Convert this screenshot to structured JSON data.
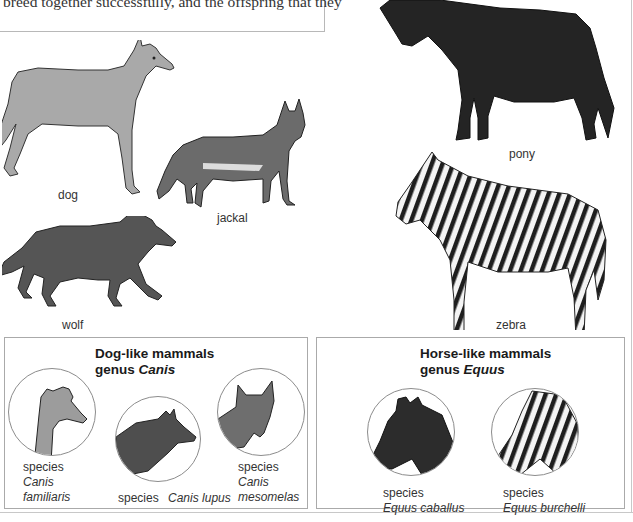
{
  "intro": {
    "text": "breed together successfully, and the offspring that they"
  },
  "illustrations": {
    "dog": {
      "label": "dog"
    },
    "jackal": {
      "label": "jackal"
    },
    "wolf": {
      "label": "wolf"
    },
    "pony": {
      "label": "pony"
    },
    "zebra": {
      "label": "zebra"
    }
  },
  "dog_box": {
    "title_line1": "Dog-like mammals",
    "title_line2_prefix": "genus ",
    "title_line2_genus": "Canis",
    "species": [
      {
        "prefix": "species",
        "name_line1": "Canis",
        "name_line2": "familiaris"
      },
      {
        "prefix": "species",
        "name_line1": "Canis lupus",
        "name_line2": ""
      },
      {
        "prefix": "species",
        "name_line1": "Canis",
        "name_line2": "mesomelas"
      }
    ]
  },
  "horse_box": {
    "title_line1": "Horse-like mammals",
    "title_line2_prefix": "genus ",
    "title_line2_genus": "Equus",
    "species": [
      {
        "prefix": "species",
        "name_line1": "Equus caballus"
      },
      {
        "prefix": "species",
        "name_line1": "Equus burchelli"
      }
    ]
  },
  "colors": {
    "border": "#aaaaaa",
    "text": "#333333",
    "dog_fill": "#a8a8a8",
    "dark_fill": "#2a2a2a"
  }
}
